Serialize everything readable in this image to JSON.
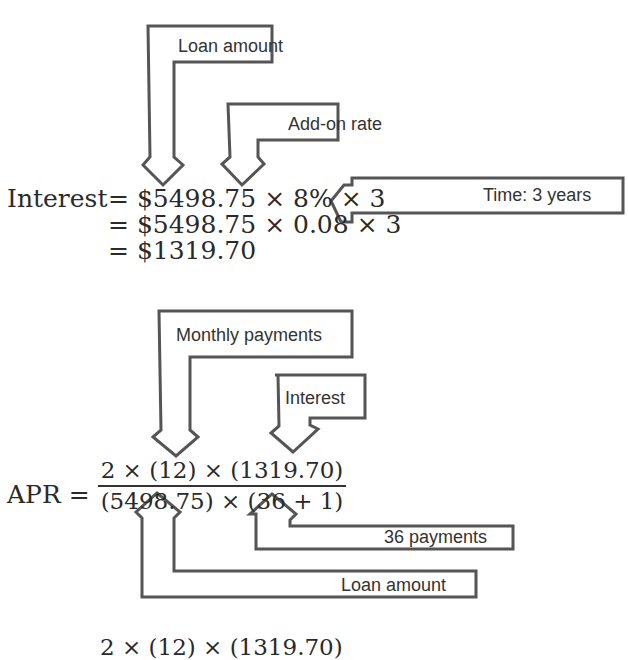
{
  "interest_section": {
    "annotations": {
      "loan_amount": "Loan amount",
      "add_on_rate": "Add-on rate",
      "time": "Time: 3 years"
    },
    "equation": {
      "lhs": "Interest",
      "line1": "= $5498.75 × 8% × 3",
      "line2": "= $5498.75 × 0.08 × 3",
      "line3": "= $1319.70"
    }
  },
  "apr_section": {
    "annotations": {
      "monthly_payments": "Monthly payments",
      "interest": "Interest",
      "payments_36": "36 payments",
      "loan_amount": "Loan amount"
    },
    "equation": {
      "lhs": "APR =",
      "numerator": "2 × (12) × (1319.70)",
      "denominator": "(5498.75) × (36 + 1)"
    },
    "next_line_partial": "2 × (12) × (1319.70)"
  },
  "colors": {
    "text": "#2a2a2a",
    "arrow_stroke": "#555555",
    "background": "#ffffff"
  }
}
